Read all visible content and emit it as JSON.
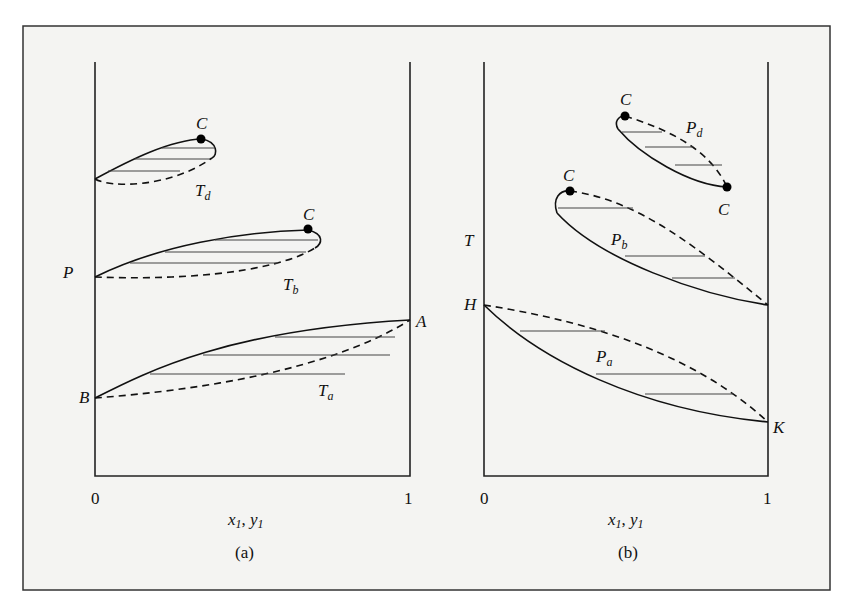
{
  "figure": {
    "panels": [
      {
        "id": "a",
        "caption": "(a)",
        "y_axis_label": "P",
        "x_axis_label": "x",
        "x_axis_label_sub1": "1",
        "x_axis_label_sep": ", ",
        "x_axis_label2": "y",
        "x_axis_label_sub2": "1",
        "x_ticks": [
          "0",
          "1"
        ],
        "curves": [
          {
            "name": "T",
            "sub": "a",
            "ends": [
              "B",
              "A"
            ]
          },
          {
            "name": "T",
            "sub": "b",
            "critical_point": "C"
          },
          {
            "name": "T",
            "sub": "d",
            "critical_point": "C"
          }
        ],
        "point_labels": {
          "A": "A",
          "B": "B",
          "C_b": "C",
          "C_d": "C"
        },
        "curve_labels": {
          "Ta": "T",
          "Ta_sub": "a",
          "Tb": "T",
          "Tb_sub": "b",
          "Td": "T",
          "Td_sub": "d"
        }
      },
      {
        "id": "b",
        "caption": "(b)",
        "y_axis_label": "T",
        "x_axis_label": "x",
        "x_axis_label_sub1": "1",
        "x_axis_label_sep": ", ",
        "x_axis_label2": "y",
        "x_axis_label_sub2": "1",
        "x_ticks": [
          "0",
          "1"
        ],
        "curves": [
          {
            "name": "P",
            "sub": "a",
            "ends": [
              "H",
              "K"
            ]
          },
          {
            "name": "P",
            "sub": "b",
            "critical_point": "C"
          },
          {
            "name": "P",
            "sub": "d",
            "critical_points": [
              "C",
              "C"
            ]
          }
        ],
        "point_labels": {
          "H": "H",
          "K": "K",
          "C_b": "C",
          "C_d1": "C",
          "C_d2": "C"
        },
        "curve_labels": {
          "Pa": "P",
          "Pa_sub": "a",
          "Pb": "P",
          "Pb_sub": "b",
          "Pd": "P",
          "Pd_sub": "d"
        }
      }
    ],
    "legend": {
      "solid_line": "bubble curve (liquid)",
      "dashed_line": "dew curve (vapor)",
      "horizontal_lines": "tie lines",
      "dot": "critical point"
    }
  }
}
